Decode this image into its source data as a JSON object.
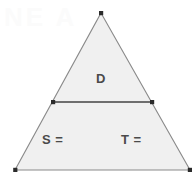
{
  "figure": {
    "kind": "geometry-diagram",
    "canvas": {
      "width": 195,
      "height": 186,
      "background": "#ffffff"
    },
    "watermark_text": "NE A",
    "colors": {
      "interior_fill": "#f0f0f0",
      "outline_stroke": "#8a8a8a",
      "midline_stroke": "#6e6e6e",
      "vertex_dot": "#2b2b2b",
      "label_text": "#4a4a4a"
    },
    "triangle": {
      "name": "outer-triangle",
      "vertices": [
        {
          "name": "apex",
          "x": 101,
          "y": 13
        },
        {
          "name": "bottom-right",
          "x": 190,
          "y": 170
        },
        {
          "name": "bottom-left",
          "x": 15,
          "y": 170
        }
      ]
    },
    "midline": {
      "name": "horizontal-divider",
      "from": {
        "x": 53,
        "y": 102
      },
      "to": {
        "x": 152,
        "y": 102
      }
    },
    "vertex_points": [
      {
        "name": "point-apex",
        "x": 101,
        "y": 13
      },
      {
        "name": "point-midline-left",
        "x": 53,
        "y": 102
      },
      {
        "name": "point-midline-right",
        "x": 152,
        "y": 102
      },
      {
        "name": "point-bottom-left",
        "x": 15,
        "y": 170
      },
      {
        "name": "point-bottom-right",
        "x": 190,
        "y": 170
      }
    ],
    "labels": [
      {
        "id": "label-d",
        "text": "D",
        "x": 96,
        "y": 72
      },
      {
        "id": "label-s",
        "text": "S =",
        "x": 42,
        "y": 133
      },
      {
        "id": "label-t",
        "text": "T =",
        "x": 121,
        "y": 133
      }
    ]
  }
}
